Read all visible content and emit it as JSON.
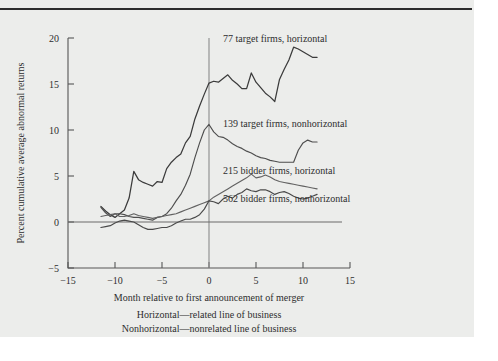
{
  "figure": {
    "background_color": "#ecedeb",
    "page_color": "#ffffff",
    "rule_color": "#2c2c2c"
  },
  "chart_data": {
    "type": "line",
    "title": "",
    "subtitle": "",
    "xlabel": "Month relative to first announcement of merger",
    "ylabel": "Percent cumulative average abnormal returns",
    "xlim": [
      -15,
      15
    ],
    "ylim": [
      -5,
      20
    ],
    "xticks": [
      -15,
      -10,
      -5,
      0,
      5,
      10,
      15
    ],
    "xtick_labels": [
      "−15",
      "−10",
      "−5",
      "0",
      "5",
      "10",
      "15"
    ],
    "yticks": [
      -5,
      0,
      5,
      10,
      15,
      20
    ],
    "ytick_labels": [
      "−5",
      "0",
      "5",
      "10",
      "15",
      "20"
    ],
    "grid": false,
    "legend_position": "inline-right",
    "annotations": [
      "Horizontal—related line of business",
      "Nonhorizontal—nonrelated line of business"
    ],
    "reference_lines": [
      {
        "name": "announcement-month",
        "orientation": "vertical",
        "value": 0
      },
      {
        "name": "zero-return",
        "orientation": "horizontal",
        "value": 0
      }
    ],
    "series": [
      {
        "name": "77 target firms, horizontal",
        "label": "77 target firms, horizontal",
        "color": "#3b3b3b",
        "label_x": 1.5,
        "label_y": 19.6,
        "x": [
          -11.5,
          -11,
          -10.5,
          -10,
          -9.5,
          -9,
          -8.5,
          -8,
          -7.5,
          -7,
          -6.5,
          -6,
          -5.5,
          -5,
          -4.5,
          -4,
          -3.5,
          -3,
          -2.5,
          -2,
          -1.5,
          -1,
          -0.5,
          0,
          0.5,
          1,
          1.5,
          2,
          2.5,
          3,
          3.5,
          4,
          4.5,
          5,
          5.5,
          6,
          6.5,
          7,
          7.5,
          8,
          8.5,
          9,
          9.5,
          10,
          10.5,
          11,
          11.5
        ],
        "y": [
          1.7,
          1.2,
          0.8,
          0.5,
          0.9,
          1.3,
          2.6,
          5.5,
          4.6,
          4.3,
          4.1,
          3.9,
          4.4,
          4.3,
          5.8,
          6.5,
          7.0,
          7.4,
          8.6,
          9.3,
          11.2,
          12.6,
          13.9,
          15.1,
          15.3,
          15.2,
          15.6,
          16.0,
          15.4,
          15.0,
          14.5,
          14.5,
          16.2,
          15.2,
          14.6,
          14.0,
          13.6,
          13.1,
          15.5,
          16.6,
          17.6,
          19.0,
          18.8,
          18.5,
          18.2,
          17.9,
          17.9
        ]
      },
      {
        "name": "139 target firms, nonhorizontal",
        "label": "139 target firms, nonhorizontal",
        "color": "#4e4e4e",
        "label_x": 1.5,
        "label_y": 10.3,
        "x": [
          -11.5,
          -11,
          -10.5,
          -10,
          -9.5,
          -9,
          -8.5,
          -8,
          -7.5,
          -7,
          -6.5,
          -6,
          -5.5,
          -5,
          -4.5,
          -4,
          -3.5,
          -3,
          -2.5,
          -2,
          -1.5,
          -1,
          -0.5,
          0,
          0.5,
          1,
          1.5,
          2,
          2.5,
          3,
          3.5,
          4,
          4.5,
          5,
          5.5,
          6,
          6.5,
          7,
          7.5,
          8,
          8.5,
          9,
          9.5,
          10,
          10.5,
          11,
          11.5
        ],
        "y": [
          1.6,
          1.0,
          0.6,
          0.9,
          0.9,
          0.8,
          0.6,
          0.5,
          0.5,
          0.4,
          0.3,
          0.2,
          0.5,
          0.6,
          0.9,
          1.5,
          2.3,
          3.0,
          4.0,
          5.2,
          7.0,
          8.6,
          10.0,
          10.6,
          9.8,
          9.3,
          9.2,
          8.9,
          8.5,
          8.2,
          8.0,
          7.7,
          7.5,
          7.2,
          7.0,
          6.9,
          6.7,
          6.6,
          6.5,
          6.5,
          6.5,
          6.5,
          7.8,
          8.6,
          8.9,
          8.7,
          8.7
        ]
      },
      {
        "name": "215 bidder firms, horizontal",
        "label": "215 bidder firms, horizontal",
        "color": "#626262",
        "label_x": 1.5,
        "label_y": 5.2,
        "x": [
          -11.5,
          -11,
          -10.5,
          -10,
          -9.5,
          -9,
          -8.5,
          -8,
          -7.5,
          -7,
          -6.5,
          -6,
          -5.5,
          -5,
          -4.5,
          -4,
          -3.5,
          -3,
          -2.5,
          -2,
          -1.5,
          -1,
          -0.5,
          0,
          0.5,
          1,
          1.5,
          2,
          2.5,
          3,
          3.5,
          4,
          4.5,
          5,
          5.5,
          6,
          6.5,
          7,
          7.5,
          8,
          8.5,
          9,
          9.5,
          10,
          10.5,
          11,
          11.5
        ],
        "y": [
          0.6,
          0.7,
          0.8,
          0.9,
          0.6,
          0.6,
          0.7,
          0.9,
          0.7,
          0.6,
          0.5,
          0.4,
          0.5,
          0.6,
          0.7,
          0.8,
          0.9,
          1.1,
          1.3,
          1.5,
          1.7,
          1.9,
          2.1,
          2.3,
          2.7,
          3.0,
          3.3,
          3.6,
          3.9,
          4.2,
          4.5,
          4.8,
          5.2,
          4.8,
          4.9,
          5.1,
          4.9,
          4.6,
          4.4,
          4.3,
          4.2,
          4.1,
          4.0,
          3.9,
          3.8,
          3.7,
          3.6
        ]
      },
      {
        "name": "562 bidder firms, nonhorizontal",
        "label": "562 bidder firms, nonhorizontal",
        "color": "#4a4a4a",
        "label_x": 1.5,
        "label_y": 2.2,
        "x": [
          -11.5,
          -11,
          -10.5,
          -10,
          -9.5,
          -9,
          -8.5,
          -8,
          -7.5,
          -7,
          -6.5,
          -6,
          -5.5,
          -5,
          -4.5,
          -4,
          -3.5,
          -3,
          -2.5,
          -2,
          -1.5,
          -1,
          -0.5,
          0,
          0.5,
          1,
          1.5,
          2,
          2.5,
          3,
          3.5,
          4,
          4.5,
          5,
          5.5,
          6,
          6.5,
          7,
          7.5,
          8,
          8.5,
          9,
          9.5,
          10,
          10.5,
          11,
          11.5
        ],
        "y": [
          -0.6,
          -0.5,
          -0.4,
          -0.1,
          0.1,
          0.2,
          0.1,
          0.0,
          -0.3,
          -0.6,
          -0.8,
          -0.8,
          -0.7,
          -0.6,
          -0.6,
          -0.4,
          -0.1,
          0.1,
          0.3,
          0.3,
          0.5,
          0.8,
          1.4,
          2.3,
          2.2,
          2.0,
          2.5,
          2.8,
          2.6,
          3.0,
          3.2,
          3.6,
          3.4,
          3.3,
          3.5,
          3.5,
          3.3,
          3.0,
          3.2,
          3.3,
          3.1,
          2.8,
          2.6,
          2.5,
          2.6,
          2.8,
          3.0
        ]
      }
    ]
  }
}
